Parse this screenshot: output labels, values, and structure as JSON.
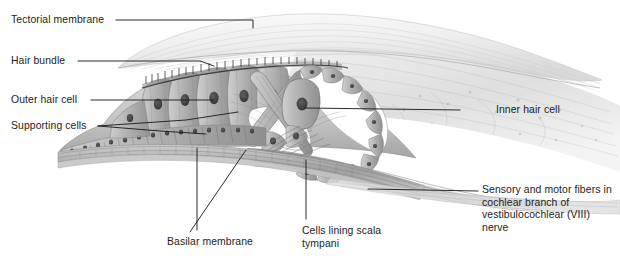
{
  "figure": {
    "background_color": "#ffffff",
    "label_color": "#1c1c1c",
    "leader_line_color": "#202020",
    "palette": {
      "tectorial_light": "#f2f2f2",
      "tectorial_mid": "#e2e2e2",
      "tissue_light": "#d8d8d8",
      "tissue_mid": "#b9b9b9",
      "tissue_dark": "#8e8e8e",
      "nucleus": "#4a4a4a",
      "outline": "#6f6f6f",
      "tunnel_white": "#ffffff",
      "nerve_gray": "#9a9a9a",
      "membrane_gray": "#a6a6a6"
    }
  },
  "labels": [
    {
      "id": "tectorial-membrane",
      "text": "Tectorial membrane",
      "x": 11,
      "y": 14,
      "align": "left",
      "leader": [
        [
          116,
          20
        ],
        [
          253,
          20
        ],
        [
          253,
          28
        ]
      ]
    },
    {
      "id": "hair-bundle",
      "text": "Hair bundle",
      "x": 11,
      "y": 55,
      "align": "left",
      "leader": [
        [
          78,
          61
        ],
        [
          200,
          61
        ],
        [
          214,
          66
        ]
      ]
    },
    {
      "id": "outer-hair-cell",
      "text": "Outer hair cell",
      "x": 11,
      "y": 94,
      "align": "left",
      "leader": [
        [
          91,
          100
        ],
        [
          196,
          100
        ],
        [
          214,
          100
        ]
      ]
    },
    {
      "id": "supporting-cells",
      "text": "Supporting cells",
      "x": 11,
      "y": 120,
      "align": "left",
      "leader": [
        [
          98,
          126
        ],
        [
          178,
          122
        ],
        [
          238,
          114
        ]
      ]
    },
    {
      "id": "inner-hair-cell",
      "text": "Inner hair cell",
      "x": 496,
      "y": 104,
      "align": "left",
      "leader": [
        [
          460,
          110
        ],
        [
          316,
          110
        ],
        [
          305,
          108
        ]
      ]
    },
    {
      "id": "sensory-motor-fibers",
      "text": "Sensory and motor fibers\nin cochlear branch of\nvestibulocochlear (VIII) nerve",
      "x": 482,
      "y": 184,
      "align": "left",
      "leader": [
        [
          478,
          191
        ],
        [
          388,
          191
        ],
        [
          368,
          189
        ]
      ]
    },
    {
      "id": "basilar-membrane",
      "text": "Basilar membrane",
      "x": 167,
      "y": 236,
      "align": "left",
      "leader": [
        [
          197,
          232
        ],
        [
          197,
          148
        ]
      ]
    },
    {
      "id": "cells-lining-scala-tympani",
      "text": "Cells lining\nscala tympani",
      "x": 302,
      "y": 225,
      "align": "left",
      "leader": [
        [
          306,
          221
        ],
        [
          306,
          160
        ]
      ]
    }
  ],
  "structures": [
    {
      "id": "tectorial-membrane",
      "label": "Tectorial membrane"
    },
    {
      "id": "hair-bundle",
      "label": "Hair bundle"
    },
    {
      "id": "outer-hair-cell",
      "label": "Outer hair cell"
    },
    {
      "id": "supporting-cells",
      "label": "Supporting cells"
    },
    {
      "id": "inner-hair-cell",
      "label": "Inner hair cell"
    },
    {
      "id": "pillar-cells",
      "label": "Pillar cells"
    },
    {
      "id": "tunnel-of-corti",
      "label": "Tunnel of Corti"
    },
    {
      "id": "basilar-membrane",
      "label": "Basilar membrane"
    },
    {
      "id": "scala-tympani-lining",
      "label": "Cells lining scala tympani"
    },
    {
      "id": "nerve-fibers",
      "label": "Sensory and motor fibers"
    }
  ]
}
